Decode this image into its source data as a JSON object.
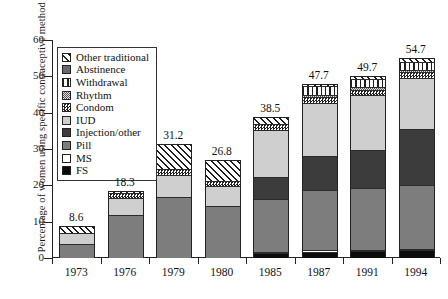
{
  "chart_data": {
    "type": "bar",
    "subtype": "stacked",
    "title": "",
    "xlabel": "",
    "ylabel": "Percentage of women using specific contraceptive method",
    "ylim": [
      0,
      60
    ],
    "yticks": [
      0,
      10,
      20,
      30,
      40,
      50,
      60
    ],
    "grid": false,
    "legend_position": "inside-top-left",
    "categories": [
      "1973",
      "1976",
      "1979",
      "1980",
      "1985",
      "1987",
      "1991",
      "1994"
    ],
    "totals": [
      8.6,
      18.3,
      31.2,
      26.8,
      38.5,
      47.7,
      49.7,
      54.7
    ],
    "series": [
      {
        "name": "FS",
        "key": "fs",
        "values": [
          0.0,
          0.0,
          0.0,
          0.0,
          1.2,
          1.5,
          1.6,
          1.8
        ]
      },
      {
        "name": "MS",
        "key": "ms",
        "values": [
          0.0,
          0.0,
          0.0,
          0.0,
          0.3,
          0.4,
          0.4,
          0.5
        ]
      },
      {
        "name": "Pill",
        "key": "pill",
        "values": [
          3.6,
          11.6,
          16.5,
          14.0,
          14.5,
          16.5,
          17.0,
          17.5
        ]
      },
      {
        "name": "Injection/other",
        "key": "inj",
        "values": [
          0.0,
          0.0,
          0.0,
          0.0,
          6.0,
          9.5,
          10.5,
          15.5
        ]
      },
      {
        "name": "IUD",
        "key": "iud",
        "values": [
          3.0,
          4.6,
          6.2,
          5.6,
          13.0,
          14.5,
          15.0,
          14.0
        ]
      },
      {
        "name": "Condom",
        "key": "condom",
        "values": [
          0.0,
          1.4,
          1.4,
          1.3,
          1.6,
          1.7,
          1.6,
          1.5
        ]
      },
      {
        "name": "Rhythm",
        "key": "rhythm",
        "values": [
          0.0,
          0.0,
          0.0,
          0.0,
          0.0,
          0.6,
          0.6,
          0.6
        ]
      },
      {
        "name": "Withdrawal",
        "key": "withdraw",
        "values": [
          0.0,
          0.0,
          0.0,
          0.0,
          0.0,
          2.3,
          2.2,
          2.4
        ]
      },
      {
        "name": "Abstinence",
        "key": "abst",
        "values": [
          0.0,
          0.0,
          0.0,
          0.0,
          0.0,
          0.0,
          0.0,
          0.0
        ]
      },
      {
        "name": "Other traditional",
        "key": "other",
        "values": [
          2.0,
          0.7,
          7.1,
          5.9,
          1.9,
          0.7,
          0.8,
          0.9
        ]
      }
    ]
  },
  "legend": {
    "items": [
      {
        "label": "Other traditional",
        "key": "other"
      },
      {
        "label": "Abstinence",
        "key": "abst"
      },
      {
        "label": "Withdrawal",
        "key": "withdraw"
      },
      {
        "label": "Rhythm",
        "key": "rhythm"
      },
      {
        "label": "Condom",
        "key": "condom"
      },
      {
        "label": "IUD",
        "key": "iud"
      },
      {
        "label": "Injection/other",
        "key": "inj"
      },
      {
        "label": "Pill",
        "key": "pill"
      },
      {
        "label": "MS",
        "key": "ms"
      },
      {
        "label": "FS",
        "key": "fs"
      }
    ]
  },
  "colors": {
    "fs": "#0b0b0b",
    "ms": "#ffffff",
    "pill": "#7d7d7d",
    "inj": "#3c3c3c",
    "iud": "#cfcfcf",
    "condom": "#222222",
    "rhythm": "#555555",
    "withdraw": "#1d1d1d",
    "abst": "#6a6a6a",
    "other": "#1d1d1d",
    "axis": "#222222"
  }
}
